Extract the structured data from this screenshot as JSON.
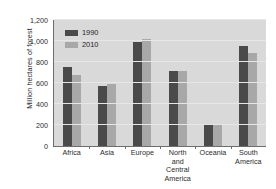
{
  "chart_data": {
    "type": "bar",
    "title": "",
    "xlabel": "",
    "ylabel": "Million hectares of forest",
    "ylim": [
      0,
      1200
    ],
    "yticks": [
      "0",
      "200",
      "400",
      "600",
      "800",
      "1,000",
      "1,200"
    ],
    "ytick_values": [
      0,
      200,
      400,
      600,
      800,
      1000,
      1200
    ],
    "grid": true,
    "legend_position": "top-left",
    "categories": [
      "Africa",
      "Asia",
      "Europe",
      "North and Central America",
      "Oceania",
      "South America"
    ],
    "category_lines": [
      [
        "Africa"
      ],
      [
        "Asia"
      ],
      [
        "Europe"
      ],
      [
        "North",
        "and Central",
        "America"
      ],
      [
        "Oceania"
      ],
      [
        "South",
        "America"
      ]
    ],
    "series": [
      {
        "name": "1990",
        "color": "#4a4a4a",
        "values": [
          750,
          575,
          990,
          710,
          205,
          955
        ]
      },
      {
        "name": "2010",
        "color": "#a8a8a8",
        "values": [
          680,
          590,
          1015,
          710,
          205,
          885
        ]
      }
    ]
  }
}
